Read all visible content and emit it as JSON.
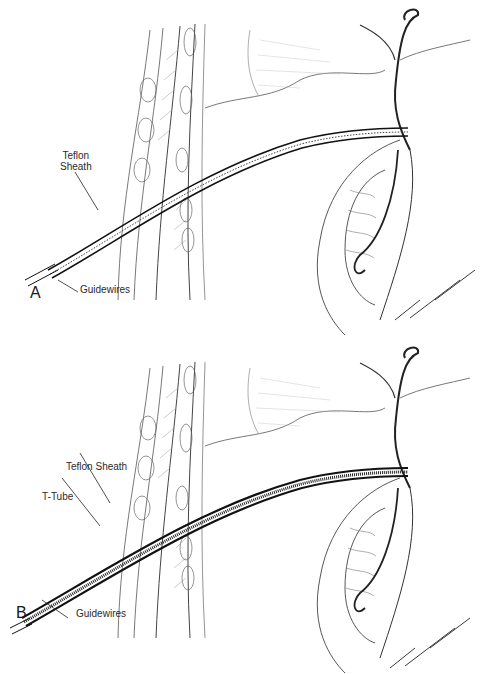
{
  "panels": [
    {
      "letter": "A",
      "labels": {
        "sheath_line1": "Teflon",
        "sheath_line2": "Sheath",
        "guidewires": "Guidewires"
      },
      "signature": "FINCH 85"
    },
    {
      "letter": "B",
      "labels": {
        "sheath": "Teflon Sheath",
        "ttube": "T-Tube",
        "guidewires": "Guidewires"
      },
      "signature": "FINCH 85"
    }
  ]
}
